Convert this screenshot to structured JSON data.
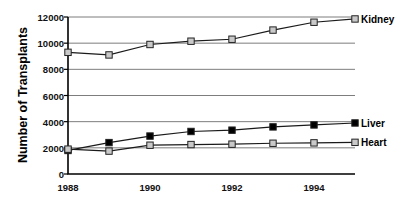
{
  "chart_data": {
    "type": "line",
    "title": "",
    "xlabel": "",
    "ylabel": "Number of Transplants",
    "x": [
      1988,
      1989,
      1990,
      1991,
      1992,
      1993,
      1994,
      1995
    ],
    "xtick_labels": [
      "1988",
      "1990",
      "1992",
      "1994"
    ],
    "xtick_values": [
      1988,
      1990,
      1992,
      1994
    ],
    "ytick_labels": [
      "0",
      "2000",
      "4000",
      "6000",
      "8000",
      "10000",
      "12000"
    ],
    "ytick_values": [
      0,
      2000,
      4000,
      6000,
      8000,
      10000,
      12000
    ],
    "ylim": [
      0,
      12000
    ],
    "xlim": [
      1988,
      1995
    ],
    "grid": "horizontal",
    "legend_position": "right-of-line-ends",
    "series": [
      {
        "name": "Kidney",
        "marker": "open-square",
        "marker_fill": "#c9c9c9",
        "values": [
          9300,
          9100,
          9900,
          10150,
          10300,
          11000,
          11600,
          11850
        ]
      },
      {
        "name": "Liver",
        "marker": "filled-square",
        "marker_fill": "#000000",
        "values": [
          1800,
          2400,
          2900,
          3250,
          3350,
          3600,
          3750,
          3900
        ]
      },
      {
        "name": "Heart",
        "marker": "open-square",
        "marker_fill": "#c9c9c9",
        "values": [
          1900,
          1750,
          2200,
          2250,
          2280,
          2350,
          2380,
          2420
        ]
      }
    ]
  },
  "axis": {
    "y_title": "Number of Transplants"
  },
  "colors": {
    "line": "#1a1a1a",
    "grid": "#7d7d7d",
    "axis": "#000000",
    "marker_open_fill": "#c9c9c9",
    "marker_filled": "#000000",
    "background": "#ffffff"
  }
}
